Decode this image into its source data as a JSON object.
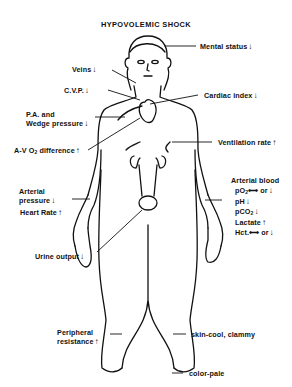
{
  "title": "HYPOVOLEMIC SHOCK",
  "arrows": {
    "up": "↑",
    "down": "↓",
    "lr": "⟷"
  },
  "labels": {
    "mental_status": {
      "text": "Mental status",
      "arrow": "↓"
    },
    "veins": {
      "text": "Veins",
      "arrow": "↓"
    },
    "cvp": {
      "text": "C.V.P.",
      "arrow": "↓"
    },
    "cardiac_index": {
      "text": "Cardiac index",
      "arrow": "↓"
    },
    "pa_wedge": {
      "line1": "P.A. and",
      "line2": "Wedge pressure",
      "arrow": "↓"
    },
    "av_o2": {
      "text": "A-V O",
      "sub": "2",
      "text2": " difference",
      "arrow": "↑"
    },
    "ventilation": {
      "text": "Ventilation rate",
      "arrow": "↑"
    },
    "arterial_pressure": {
      "line1": "Arterial",
      "line2": "pressure",
      "arrow": "↓"
    },
    "heart_rate": {
      "text": "Heart Rate",
      "arrow": "↑"
    },
    "arterial_blood": {
      "heading": "Arterial blood",
      "po2": {
        "text": "pO",
        "sub": "2",
        "change": "⟷ or",
        "arrow": "↓"
      },
      "ph": {
        "text": "pH",
        "arrow": "↓"
      },
      "pco2": {
        "text": "pCO",
        "sub": "2",
        "arrow": "↓"
      },
      "lactate": {
        "text": "Lactate",
        "arrow": "↑"
      },
      "hct": {
        "text": "Hct.",
        "change": "⟷ or",
        "arrow": "↓"
      }
    },
    "urine_output": {
      "text": "Urine output",
      "arrow": "↓"
    },
    "peripheral_resistance": {
      "line1": "Peripheral",
      "line2": "resistance",
      "arrow": "↑"
    },
    "skin": {
      "text": "skin-cool, clammy"
    },
    "color": {
      "text": "color-pale"
    }
  }
}
